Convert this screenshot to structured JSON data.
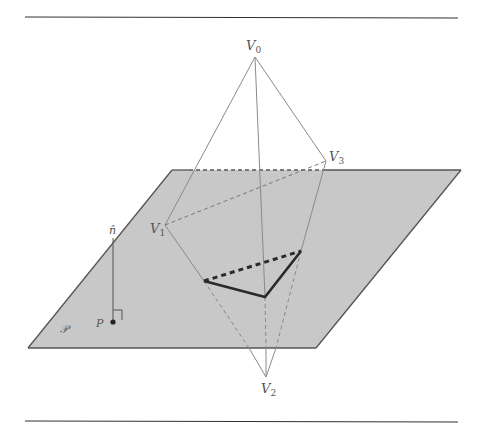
{
  "figure": {
    "type": "geometric-diagram",
    "labels": {
      "v0": {
        "main": "V",
        "sub": "0"
      },
      "v1": {
        "main": "V",
        "sub": "1"
      },
      "v2": {
        "main": "V",
        "sub": "2"
      },
      "v3": {
        "main": "V",
        "sub": "3"
      },
      "normal": "n̂",
      "point": "P",
      "plane": "𝒫"
    },
    "colors": {
      "plane_fill": "#c8c8c8",
      "plane_edge": "#555555",
      "edge": "#8a8a8a",
      "intersection": "#2a2a2a",
      "rule": "#333333"
    },
    "vertices": {
      "V0": [
        255,
        57
      ],
      "V1": [
        165,
        225
      ],
      "V2": [
        266,
        377
      ],
      "V3": [
        326,
        161
      ]
    },
    "plane_corners": [
      [
        172,
        170
      ],
      [
        461,
        170
      ],
      [
        316,
        348
      ],
      [
        28,
        348
      ]
    ],
    "intersection_polygon": [
      [
        204,
        281
      ],
      [
        265,
        297
      ],
      [
        301,
        251
      ]
    ]
  }
}
